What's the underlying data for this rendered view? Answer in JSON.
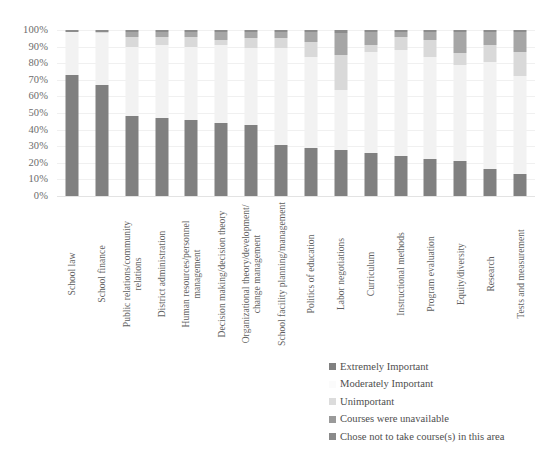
{
  "chart_data": {
    "type": "bar",
    "stacked": true,
    "stack_mode": "percent",
    "title": "",
    "xlabel": "",
    "ylabel": "",
    "ylim": [
      0,
      100
    ],
    "grid": true,
    "legend_position": "bottom-right",
    "ytick_labels": [
      "100%",
      "90%",
      "80%",
      "70%",
      "60%",
      "50%",
      "40%",
      "30%",
      "20%",
      "10%",
      "0%"
    ],
    "ytick_values": [
      100,
      90,
      80,
      70,
      60,
      50,
      40,
      30,
      20,
      10,
      0
    ],
    "categories": [
      "School law",
      "School finance",
      "Public relations/community relations",
      "District administration",
      "Human resources/personnel management",
      "Decision making/decision theory",
      "Organizational theory/development/change management",
      "School facility planning/management",
      "Politics of education",
      "Labor negotiations",
      "Curriculum",
      "Instructional methods",
      "Program evaluation",
      "Equity/diversity",
      "Research",
      "Tests and measurement"
    ],
    "category_lines": [
      [
        "School law"
      ],
      [
        "School finance"
      ],
      [
        "Public relations/community",
        "relations"
      ],
      [
        "District administration"
      ],
      [
        "Human resources/personnel",
        "management"
      ],
      [
        "Decision making/decision theory"
      ],
      [
        "Organizational theory/development/",
        "change management"
      ],
      [
        "School facility planning/management"
      ],
      [
        "Politics of education"
      ],
      [
        "Labor negotiations"
      ],
      [
        "Curriculum"
      ],
      [
        "Instructional methods"
      ],
      [
        "Program evaluation"
      ],
      [
        "Equity/diversity"
      ],
      [
        "Research"
      ],
      [
        "Tests and measurement"
      ]
    ],
    "series": [
      {
        "name": "Extremely Important",
        "color": "#808080",
        "values": [
          73,
          67,
          48,
          47,
          46,
          44,
          43,
          31,
          29,
          28,
          26,
          24,
          22,
          21,
          16,
          13
        ]
      },
      {
        "name": "Moderately Important",
        "color": "#f2f2f2",
        "values": [
          26,
          31,
          42,
          44,
          44,
          47,
          46,
          58,
          55,
          36,
          61,
          64,
          62,
          58,
          65,
          59
        ]
      },
      {
        "name": "Unimportant",
        "color": "#d9d9d9",
        "values": [
          0,
          1,
          6,
          5,
          6,
          3,
          6,
          6,
          9,
          21,
          4,
          8,
          10,
          7,
          10,
          15
        ]
      },
      {
        "name": "Courses were unavailable",
        "color": "#a6a6a6",
        "values": [
          0,
          0,
          3,
          3,
          3,
          5,
          4,
          4,
          6,
          13,
          8,
          3,
          5,
          13,
          8,
          12
        ]
      },
      {
        "name": "Chose not to take course(s) in this area",
        "color": "#8c8c8c",
        "values": [
          1,
          1,
          1,
          1,
          1,
          1,
          1,
          1,
          1,
          2,
          1,
          1,
          1,
          1,
          1,
          1
        ]
      }
    ]
  },
  "legend": {
    "items": [
      {
        "label": "Extremely Important",
        "color": "#808080"
      },
      {
        "label": "Moderately Important",
        "color": "#fbfbfb"
      },
      {
        "label": "Unimportant",
        "color": "#dcdcdc"
      },
      {
        "label": "Courses were unavailable",
        "color": "#9a9a9a"
      },
      {
        "label": "Chose not to take course(s) in this area",
        "color": "#8a8a8a"
      }
    ]
  }
}
